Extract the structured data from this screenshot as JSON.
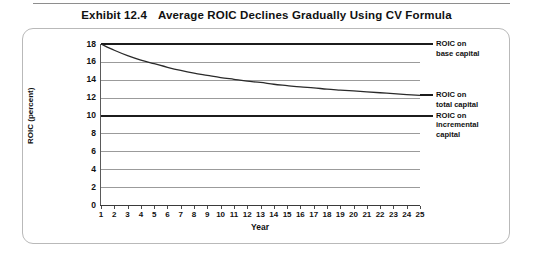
{
  "exhibit": {
    "number": "Exhibit 12.4",
    "title": "Average ROIC Declines Gradually Using CV Formula"
  },
  "chart_data": {
    "type": "line",
    "title": "Average ROIC Declines Gradually Using CV Formula",
    "xlabel": "Year",
    "ylabel": "ROIC (percent)",
    "xlim": [
      1,
      25
    ],
    "ylim": [
      0,
      18
    ],
    "grid": true,
    "legend_position": "right-inline-annotations",
    "x": [
      1,
      2,
      3,
      4,
      5,
      6,
      7,
      8,
      9,
      10,
      11,
      12,
      13,
      14,
      15,
      16,
      17,
      18,
      19,
      20,
      21,
      22,
      23,
      24,
      25
    ],
    "xticklabels": [
      "1",
      "2",
      "3",
      "4",
      "5",
      "6",
      "7",
      "8",
      "9",
      "10",
      "11",
      "12",
      "13",
      "14",
      "15",
      "16",
      "17",
      "18",
      "19",
      "20",
      "21",
      "22",
      "23",
      "24",
      "25"
    ],
    "yticks": [
      0,
      2,
      4,
      6,
      8,
      10,
      12,
      14,
      16,
      18
    ],
    "yticklabels": [
      "0",
      "2",
      "4",
      "6",
      "8",
      "10",
      "12",
      "14",
      "16",
      "18"
    ],
    "series": [
      {
        "name": "ROIC on base capital",
        "style": "horizontal-line",
        "color": "#1c1c1c",
        "value": 18,
        "values": [
          18,
          18,
          18,
          18,
          18,
          18,
          18,
          18,
          18,
          18,
          18,
          18,
          18,
          18,
          18,
          18,
          18,
          18,
          18,
          18,
          18,
          18,
          18,
          18,
          18
        ]
      },
      {
        "name": "ROIC on total capital",
        "style": "curve",
        "color": "#2a2a2a",
        "values": [
          18.0,
          17.3,
          16.7,
          16.2,
          15.8,
          15.4,
          15.05,
          14.75,
          14.5,
          14.25,
          14.05,
          13.85,
          13.7,
          13.5,
          13.35,
          13.2,
          13.1,
          12.95,
          12.85,
          12.75,
          12.65,
          12.55,
          12.45,
          12.35,
          12.25
        ]
      },
      {
        "name": "ROIC on incremental capital",
        "style": "horizontal-line",
        "color": "#1c1c1c",
        "value": 10,
        "values": [
          10,
          10,
          10,
          10,
          10,
          10,
          10,
          10,
          10,
          10,
          10,
          10,
          10,
          10,
          10,
          10,
          10,
          10,
          10,
          10,
          10,
          10,
          10,
          10,
          10
        ]
      }
    ],
    "annotations": [
      {
        "text": "ROIC on\nbase capital",
        "anchor_value": 18
      },
      {
        "text": "ROIC on\ntotal capital",
        "anchor_value": 12.25
      },
      {
        "text": "ROIC on\nincremental\ncapital",
        "anchor_value": 10
      }
    ]
  }
}
